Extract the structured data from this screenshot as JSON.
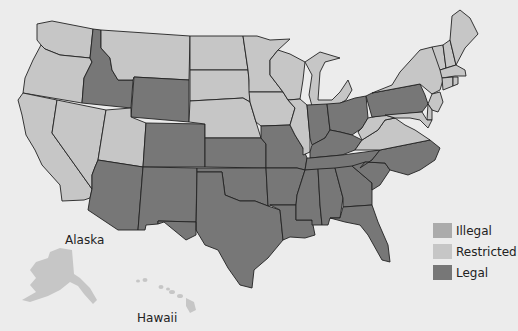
{
  "colors": {
    "illegal": "#ababab",
    "restricted": "#c6c6c6",
    "legal": "#777777",
    "background": "#ececec",
    "border": "#222222"
  },
  "labels": {
    "alaska": "Alaska",
    "hawaii": "Hawaii"
  },
  "legend": [
    {
      "key": "illegal",
      "label": "Illegal"
    },
    {
      "key": "restricted",
      "label": "Restricted"
    },
    {
      "key": "legal",
      "label": "Legal"
    }
  ],
  "states": {
    "WA": "restricted",
    "OR": "restricted",
    "CA": "restricted",
    "NV": "restricted",
    "ID": "legal",
    "MT": "restricted",
    "WY": "legal",
    "UT": "restricted",
    "CO": "legal",
    "AZ": "legal",
    "NM": "legal",
    "ND": "restricted",
    "SD": "restricted",
    "NE": "restricted",
    "KS": "legal",
    "OK": "legal",
    "TX": "legal",
    "MN": "restricted",
    "IA": "restricted",
    "MO": "legal",
    "AR": "legal",
    "LA": "legal",
    "WI": "restricted",
    "IL": "restricted",
    "MI": "restricted",
    "IN": "legal",
    "OH": "legal",
    "KY": "legal",
    "TN": "legal",
    "MS": "legal",
    "AL": "legal",
    "GA": "legal",
    "FL": "legal",
    "SC": "legal",
    "NC": "legal",
    "VA": "restricted",
    "WV": "restricted",
    "PA": "legal",
    "NY": "restricted",
    "VT": "restricted",
    "NH": "restricted",
    "ME": "restricted",
    "MA": "restricted",
    "CT": "restricted",
    "RI": "restricted",
    "NJ": "restricted",
    "DE": "restricted",
    "MD": "restricted",
    "AK": "restricted",
    "HI": "restricted"
  }
}
